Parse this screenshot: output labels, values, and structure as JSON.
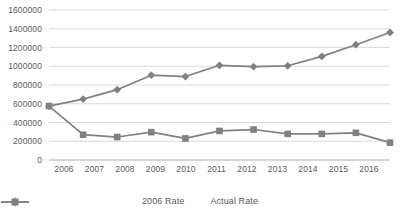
{
  "chart_data": {
    "type": "line",
    "title": "",
    "xlabel": "",
    "ylabel": "",
    "categories": [
      "2006",
      "2007",
      "2008",
      "2009",
      "2010",
      "2011",
      "2012",
      "2013",
      "2014",
      "2015",
      "2016"
    ],
    "ylim": [
      0,
      1600000
    ],
    "ytick_values": [
      0,
      200000,
      400000,
      600000,
      800000,
      1000000,
      1200000,
      1400000,
      1600000
    ],
    "ytick_labels": [
      "0",
      "200000",
      "400000",
      "600000",
      "800000",
      "1000000",
      "1200000",
      "1400000",
      "1600000"
    ],
    "grid": true,
    "legend_position": "bottom",
    "series": [
      {
        "name": "2006 Rate",
        "marker": "diamond",
        "color": "#808080",
        "values": [
          575000,
          650000,
          750000,
          905000,
          890000,
          1010000,
          995000,
          1005000,
          1105000,
          1230000,
          1360000
        ]
      },
      {
        "name": "Actual Rate",
        "marker": "square",
        "color": "#808080",
        "values": [
          575000,
          270000,
          245000,
          297000,
          230000,
          310000,
          325000,
          278000,
          278000,
          290000,
          185000
        ]
      }
    ]
  },
  "axis": {
    "yticks": [
      "1600000",
      "1400000",
      "1200000",
      "1000000",
      "800000",
      "600000",
      "400000",
      "200000",
      "0"
    ],
    "xticks": [
      "2006",
      "2007",
      "2008",
      "2009",
      "2010",
      "2011",
      "2012",
      "2013",
      "2014",
      "2015",
      "2016"
    ]
  },
  "legend": {
    "entries": [
      {
        "label": "2006 Rate",
        "marker": "diamond-marker-icon"
      },
      {
        "label": "Actual Rate",
        "marker": "square-marker-icon"
      }
    ]
  },
  "colors": {
    "series": "#808080",
    "grid": "#d9d9d9",
    "axis_text": "#5a5a5a",
    "background": "#ffffff"
  }
}
